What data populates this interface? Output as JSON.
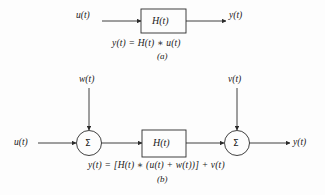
{
  "figure": {
    "stroke_color": "#2b2b2b",
    "text_color": "#1a1a1a",
    "background_color": "#fdfdfd"
  },
  "part_a": {
    "caption": "(a)",
    "equation": "y(t) = H(t) ∗ u(t)",
    "input_label": "u(t)",
    "block_label": "H(t)",
    "output_label": "y(t)"
  },
  "part_b": {
    "caption": "(b)",
    "equation": "y(t) = [H(t) ∗ (u(t) + w(t))] + v(t)",
    "input_label": "u(t)",
    "noise_input_label": "w(t)",
    "noise_output_label": "v(t)",
    "block_label": "H(t)",
    "output_label": "y(t)",
    "summer_symbol_1": "Σ",
    "summer_symbol_2": "Σ"
  }
}
